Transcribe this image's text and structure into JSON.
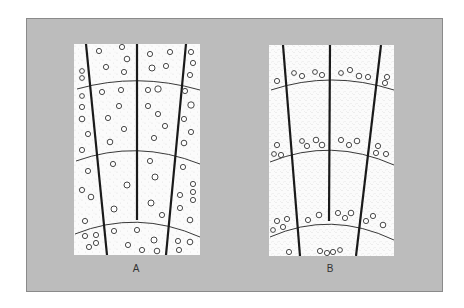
{
  "figure": {
    "background_color": "#bcbcbc",
    "panel_color": "#fbfbfb",
    "line_color": "#1a1a1a"
  },
  "panels": [
    {
      "id": "A",
      "label": "A",
      "description": "diffuse-porous wood: pores scattered evenly through growth rings",
      "pore_distribution": "diffuse"
    },
    {
      "id": "B",
      "label": "B",
      "description": "ring-porous wood: pores concentrated at start of each growth ring",
      "pore_distribution": "ring"
    }
  ]
}
